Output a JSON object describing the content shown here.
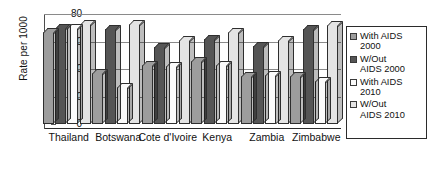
{
  "chart_data": {
    "type": "bar",
    "title": "",
    "xlabel": "",
    "ylabel": "Rate per 1000",
    "ylim": [
      0,
      80
    ],
    "yticks": [
      0,
      20,
      40,
      60,
      80
    ],
    "grid": true,
    "legend_position": "right",
    "categories": [
      "Thailand",
      "Botswana",
      "Cote d'Ivoire",
      "Kenya",
      "Zambia",
      "Zimbabwe"
    ],
    "series": [
      {
        "name": "With AIDS 2000",
        "color": "#9d9d9d",
        "values": [
          67,
          37,
          43,
          46,
          35,
          35
        ]
      },
      {
        "name": "W/Out AIDS 2000",
        "color": "#555555",
        "values": [
          70,
          69,
          56,
          62,
          57,
          69
        ]
      },
      {
        "name": "With AIDS 2010",
        "color": "#fbfbfb",
        "values": [
          70,
          27,
          42,
          43,
          36,
          31
        ]
      },
      {
        "name": "W/Out AIDS 2010",
        "color": "#e4e4e4",
        "values": [
          73,
          73,
          61,
          67,
          61,
          72
        ]
      }
    ]
  },
  "axis": {
    "y_title": "Rate per 1000",
    "tick_labels": [
      "80",
      "60",
      "40",
      "20",
      "0"
    ]
  },
  "legend": {
    "items": [
      {
        "label": "With AIDS\n2000"
      },
      {
        "label": "W/Out\nAIDS 2000"
      },
      {
        "label": "With AIDS\n2010"
      },
      {
        "label": "W/Out\nAIDS 2010"
      }
    ]
  }
}
